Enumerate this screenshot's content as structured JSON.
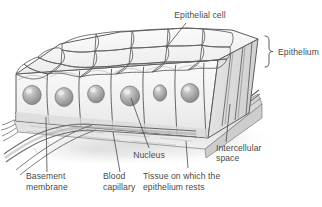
{
  "figure": {
    "type": "biological-diagram",
    "background_color": "#ffffff",
    "ink_color": "#4a4a4a",
    "line_color": "#5a5a5a",
    "cell_fill": "#f2f2f2",
    "nucleus_color": "#9a9a9a",
    "tissue_fill": "#dcdcdc"
  },
  "labels": {
    "epithelial_cell": "Epithelial cell",
    "epithelium": "Epithelium",
    "intercellular_space_line1": "Intercellular",
    "intercellular_space_line2": "space",
    "nucleus": "Nucleus",
    "tissue_line1": "Tissue on which the",
    "tissue_line2": "epithelium rests",
    "blood_capillary_line1": "Blood",
    "blood_capillary_line2": "capillary",
    "basement_membrane_line1": "Basement",
    "basement_membrane_line2": "membrane"
  },
  "structures": {
    "epithelial_cells_visible": 6,
    "nuclei_visible": 6,
    "brace_label": "Epithelium",
    "layers": [
      "epithelium",
      "basement membrane",
      "connective tissue",
      "blood capillary"
    ]
  }
}
